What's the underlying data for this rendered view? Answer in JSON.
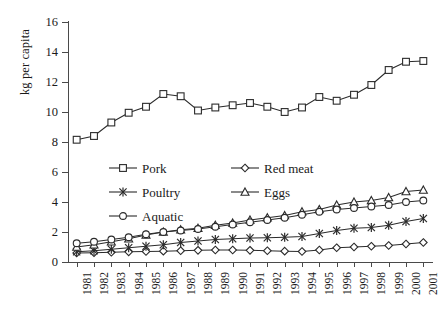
{
  "chart_data": {
    "type": "line",
    "title": "",
    "subtitle": "",
    "xlabel": "",
    "ylabel": "kg per capita",
    "grid": false,
    "legend_position": "inside-upper-middle",
    "legend_columns": 2,
    "ylim": [
      0,
      16
    ],
    "ytick_step": 2,
    "yticks": [
      0,
      2,
      4,
      6,
      8,
      10,
      12,
      14,
      16
    ],
    "ytick_labels": [
      "0",
      "2",
      "4",
      "6",
      "8",
      "10",
      "12",
      "14",
      "16"
    ],
    "x": [
      1981,
      1982,
      1983,
      1984,
      1985,
      1986,
      1987,
      1988,
      1989,
      1990,
      1991,
      1992,
      1993,
      1994,
      1995,
      1996,
      1997,
      1998,
      1999,
      2000,
      2001
    ],
    "categories": [
      "1981",
      "1982",
      "1983",
      "1984",
      "1985",
      "1986",
      "1987",
      "1988",
      "1989",
      "1990",
      "1991",
      "1992",
      "1993",
      "1994",
      "1995",
      "1996",
      "1997",
      "1998",
      "1999",
      "2000",
      "2001"
    ],
    "xtick_labels": [
      "1981",
      "1982",
      "1983",
      "1984",
      "1985",
      "1986",
      "1987",
      "1988",
      "1989",
      "1990",
      "1991",
      "1992",
      "1993",
      "1994",
      "1995",
      "1996",
      "1997",
      "1998",
      "1999",
      "2000",
      "2001"
    ],
    "xtick_rotation": 90,
    "series": [
      {
        "name": "Pork",
        "marker": "square",
        "color": "#2b2b2b",
        "values": [
          8.15,
          8.4,
          9.3,
          9.95,
          10.35,
          11.2,
          11.05,
          10.1,
          10.3,
          10.45,
          10.6,
          10.35,
          10.0,
          10.3,
          11.0,
          10.75,
          11.15,
          11.8,
          12.8,
          13.35,
          13.4
        ]
      },
      {
        "name": "Red meat",
        "marker": "diamond",
        "color": "#2b2b2b",
        "values": [
          0.6,
          0.62,
          0.65,
          0.68,
          0.7,
          0.72,
          0.75,
          0.78,
          0.8,
          0.8,
          0.78,
          0.75,
          0.72,
          0.7,
          0.8,
          0.95,
          1.0,
          1.05,
          1.1,
          1.2,
          1.3
        ]
      },
      {
        "name": "Poultry",
        "marker": "star",
        "color": "#2b2b2b",
        "values": [
          0.68,
          0.75,
          0.85,
          0.95,
          1.05,
          1.15,
          1.3,
          1.4,
          1.5,
          1.55,
          1.6,
          1.62,
          1.65,
          1.7,
          1.9,
          2.1,
          2.25,
          2.3,
          2.45,
          2.7,
          2.9
        ]
      },
      {
        "name": "Eggs",
        "marker": "triangle",
        "color": "#2b2b2b",
        "values": [
          1.0,
          1.15,
          1.35,
          1.55,
          1.8,
          2.0,
          2.15,
          2.25,
          2.45,
          2.6,
          2.8,
          2.95,
          3.1,
          3.35,
          3.5,
          3.8,
          4.0,
          4.1,
          4.3,
          4.7,
          4.8
        ]
      },
      {
        "name": "Aquatic",
        "marker": "circle",
        "color": "#2b2b2b",
        "values": [
          1.25,
          1.35,
          1.5,
          1.65,
          1.85,
          2.0,
          2.1,
          2.2,
          2.35,
          2.5,
          2.65,
          2.8,
          2.95,
          3.15,
          3.35,
          3.5,
          3.6,
          3.7,
          3.8,
          4.0,
          4.1
        ]
      }
    ]
  },
  "axis": {
    "y_title": "kg per capita"
  },
  "legend": {
    "entries": [
      {
        "label": "Pork",
        "marker": "square"
      },
      {
        "label": "Red meat",
        "marker": "diamond"
      },
      {
        "label": "Poultry",
        "marker": "star"
      },
      {
        "label": "Eggs",
        "marker": "triangle"
      },
      {
        "label": "Aquatic",
        "marker": "circle"
      }
    ]
  }
}
